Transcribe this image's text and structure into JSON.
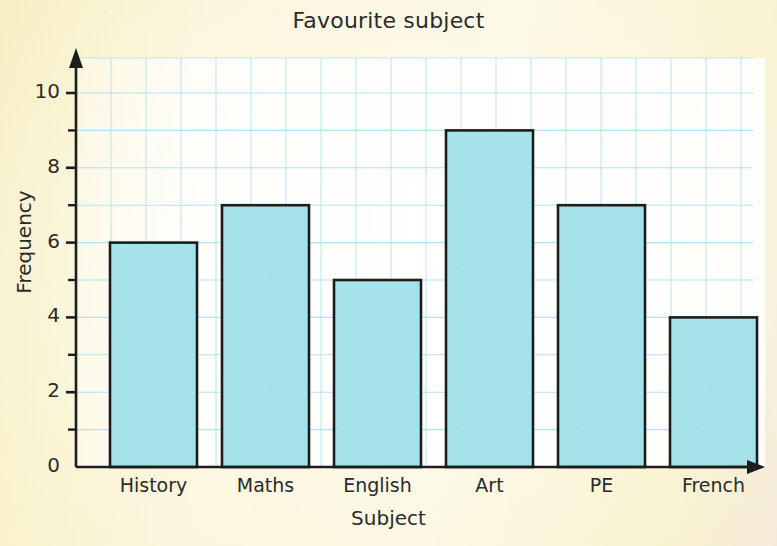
{
  "chart_data": {
    "type": "bar",
    "title": "Favourite subject",
    "xlabel": "Subject",
    "ylabel": "Frequency",
    "categories": [
      "History",
      "Maths",
      "English",
      "Art",
      "PE",
      "French"
    ],
    "values": [
      6,
      7,
      5,
      9,
      7,
      4
    ],
    "ylim": [
      0,
      10
    ],
    "ytick_labels": [
      "0",
      "2",
      "4",
      "6",
      "8",
      "10"
    ],
    "ytick_values": [
      0,
      2,
      4,
      6,
      8,
      10
    ],
    "yminor_tick_values": [
      1,
      3,
      5,
      7,
      9
    ],
    "grid": true,
    "legend": "none",
    "bar_fill_color": "#a4e3ea",
    "bar_edge_color": "#1d1d1d",
    "grid_color": "#aadff0",
    "axis_color": "#1d1d1d",
    "plot_background_color": "#fdfbf2",
    "page_background_color": "#faf4d2",
    "text_color": "#2b2b2b"
  }
}
